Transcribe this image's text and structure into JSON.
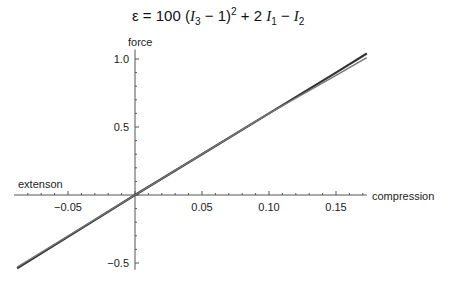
{
  "chart_data": {
    "type": "line",
    "xlabel_right": "compression",
    "xlabel_left": "extenson",
    "ylabel": "force",
    "xlim": [
      -0.088,
      0.173
    ],
    "ylim": [
      -0.55,
      1.07
    ],
    "x_ticks": [
      -0.05,
      0.05,
      0.1,
      0.15
    ],
    "x_tick_labels": [
      "-0.05",
      "0.05",
      "0.10",
      "0.15"
    ],
    "y_ticks": [
      -0.5,
      0.5,
      1.0
    ],
    "y_tick_labels": [
      "-0.5",
      "0.5",
      "1.0"
    ],
    "grid": false,
    "series": [
      {
        "name": "curve-1",
        "color": "#333333",
        "x": [
          -0.088,
          0.0,
          0.05,
          0.1,
          0.15,
          0.173
        ],
        "y": [
          -0.54,
          0.0,
          0.3,
          0.6,
          0.9,
          1.04
        ]
      },
      {
        "name": "curve-2",
        "color": "#777777",
        "x": [
          -0.088,
          0.0,
          0.05,
          0.1,
          0.15,
          0.173
        ],
        "y": [
          -0.53,
          0.0,
          0.3,
          0.6,
          0.88,
          1.01
        ]
      }
    ]
  },
  "labels": {
    "title_prefix": "ε = 100 (",
    "ylabel": "force",
    "xlabel_left": "extenson",
    "xlabel_right": "compression"
  }
}
